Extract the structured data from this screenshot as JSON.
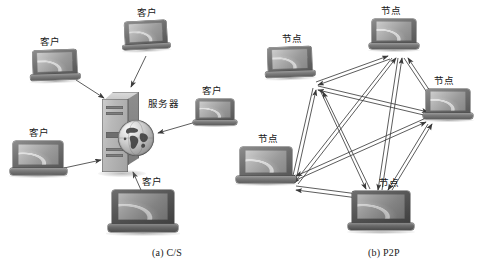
{
  "figure": {
    "background_color": "#ffffff",
    "line_color": "#3c3c3c"
  },
  "panels": [
    {
      "id": "cs",
      "caption": "(a) C/S",
      "caption_pos": {
        "x": 152,
        "y": 247
      },
      "server": {
        "label": "服务器",
        "label_pos": {
          "x": 148,
          "y": 99
        },
        "icon": "server-tower-globe"
      },
      "clients": [
        {
          "id": "client-top-left",
          "label": "客户",
          "label_pos": {
            "x": 40,
            "y": 37
          },
          "laptop": {
            "x": 33,
            "y": 50,
            "w": 44,
            "h": 34
          },
          "dark": false
        },
        {
          "id": "client-top-center",
          "label": "客户",
          "label_pos": {
            "x": 137,
            "y": 8
          },
          "laptop": {
            "x": 125,
            "y": 21,
            "w": 42,
            "h": 32
          },
          "dark": false
        },
        {
          "id": "client-right",
          "label": "客户",
          "label_pos": {
            "x": 202,
            "y": 86
          },
          "laptop": {
            "x": 196,
            "y": 99,
            "w": 38,
            "h": 29
          },
          "dark": false
        },
        {
          "id": "client-bottom-left",
          "label": "客户",
          "label_pos": {
            "x": 29,
            "y": 128
          },
          "laptop": {
            "x": 13,
            "y": 141,
            "w": 50,
            "h": 38
          },
          "dark": false
        },
        {
          "id": "client-bottom",
          "label": "客户",
          "label_pos": {
            "x": 142,
            "y": 177
          },
          "laptop": {
            "x": 112,
            "y": 190,
            "w": 62,
            "h": 47
          },
          "dark": true
        }
      ],
      "links": [
        {
          "from": "client-top-left",
          "to": "server",
          "arrow": "to"
        },
        {
          "from": "client-top-center",
          "to": "server",
          "arrow": "to"
        },
        {
          "from": "client-right",
          "to": "server",
          "arrow": "to"
        },
        {
          "from": "client-bottom-left",
          "to": "server",
          "arrow": "to"
        },
        {
          "from": "client-bottom",
          "to": "server",
          "arrow": "to"
        }
      ]
    },
    {
      "id": "p2p",
      "caption": "(b) P2P",
      "caption_pos": {
        "x": 368,
        "y": 247
      },
      "peers": [
        {
          "id": "peer-top",
          "label": "节点",
          "label_pos": {
            "x": 381,
            "y": 6
          },
          "laptop": {
            "x": 372,
            "y": 19,
            "w": 44,
            "h": 34
          },
          "dark": false
        },
        {
          "id": "peer-upper-left",
          "label": "节点",
          "label_pos": {
            "x": 282,
            "y": 34
          },
          "laptop": {
            "x": 268,
            "y": 47,
            "w": 44,
            "h": 34
          },
          "dark": false
        },
        {
          "id": "peer-right",
          "label": "节点",
          "label_pos": {
            "x": 434,
            "y": 76
          },
          "laptop": {
            "x": 426,
            "y": 89,
            "w": 44,
            "h": 34
          },
          "dark": false
        },
        {
          "id": "peer-left",
          "label": "节点",
          "label_pos": {
            "x": 258,
            "y": 134
          },
          "laptop": {
            "x": 240,
            "y": 147,
            "w": 52,
            "h": 40
          },
          "dark": false
        },
        {
          "id": "peer-bottom",
          "label": "节点",
          "label_pos": {
            "x": 379,
            "y": 178
          },
          "laptop": {
            "x": 352,
            "y": 191,
            "w": 58,
            "h": 44
          },
          "dark": true
        }
      ],
      "links": [
        {
          "from": "peer-upper-left",
          "to": "peer-top",
          "arrow": "both"
        },
        {
          "from": "peer-upper-left",
          "to": "peer-right",
          "arrow": "both"
        },
        {
          "from": "peer-upper-left",
          "to": "peer-left",
          "arrow": "both"
        },
        {
          "from": "peer-upper-left",
          "to": "peer-bottom",
          "arrow": "both"
        },
        {
          "from": "peer-top",
          "to": "peer-right",
          "arrow": "both"
        },
        {
          "from": "peer-top",
          "to": "peer-left",
          "arrow": "both"
        },
        {
          "from": "peer-top",
          "to": "peer-bottom",
          "arrow": "both"
        },
        {
          "from": "peer-right",
          "to": "peer-left",
          "arrow": "both"
        },
        {
          "from": "peer-right",
          "to": "peer-bottom",
          "arrow": "both"
        },
        {
          "from": "peer-left",
          "to": "peer-bottom",
          "arrow": "both"
        }
      ]
    }
  ]
}
